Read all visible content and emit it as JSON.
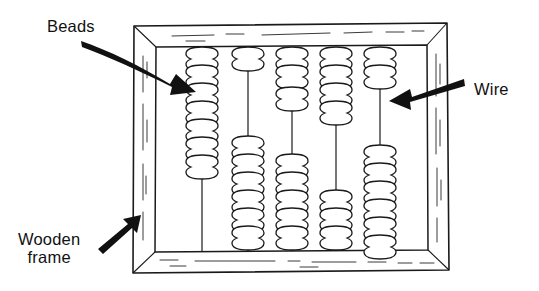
{
  "figure": {
    "background_color": "#ffffff",
    "ink_color": "#111111",
    "line_color": "#1a1a1a",
    "bead_fill": "#ffffff",
    "arrow_color": "#111111"
  },
  "labels": {
    "beads": "Beads",
    "wire": "Wire",
    "wooden_frame": "Wooden\nframe"
  },
  "annotations": [
    {
      "name": "beads-annotation",
      "text": "Beads",
      "arrow_style": "curved",
      "points_to": "top bead cluster on first wire",
      "direction": "down-right"
    },
    {
      "name": "wire-annotation",
      "text": "Wire",
      "arrow_style": "straight",
      "points_to": "bare wire segment on fifth wire",
      "direction": "down-left"
    },
    {
      "name": "wooden-frame-annotation",
      "text": "Wooden frame",
      "arrow_style": "straight",
      "points_to": "lower-left frame rail",
      "direction": "up-right"
    }
  ],
  "abacus": {
    "frame": {
      "outer": {
        "x": 131,
        "y": 25,
        "width": 318,
        "height": 248
      },
      "inner": {
        "x": 152,
        "y": 46,
        "width": 276,
        "height": 205
      },
      "material": "wood",
      "corner_style": "mitred perspective"
    },
    "wire_count": 5,
    "bead_total": 43,
    "wires": [
      {
        "index": 1,
        "label": "wire-1",
        "x": 202,
        "top_beads": 9,
        "bottom_beads": 0
      },
      {
        "index": 2,
        "label": "wire-2",
        "x": 248,
        "top_beads": 1,
        "bottom_beads": 7
      },
      {
        "index": 3,
        "label": "wire-3",
        "x": 292,
        "top_beads": 3,
        "bottom_beads": 6
      },
      {
        "index": 4,
        "label": "wire-4",
        "x": 336,
        "top_beads": 5,
        "bottom_beads": 4
      },
      {
        "index": 5,
        "label": "wire-5",
        "x": 380,
        "top_beads": 2,
        "bottom_beads": 6
      }
    ]
  }
}
